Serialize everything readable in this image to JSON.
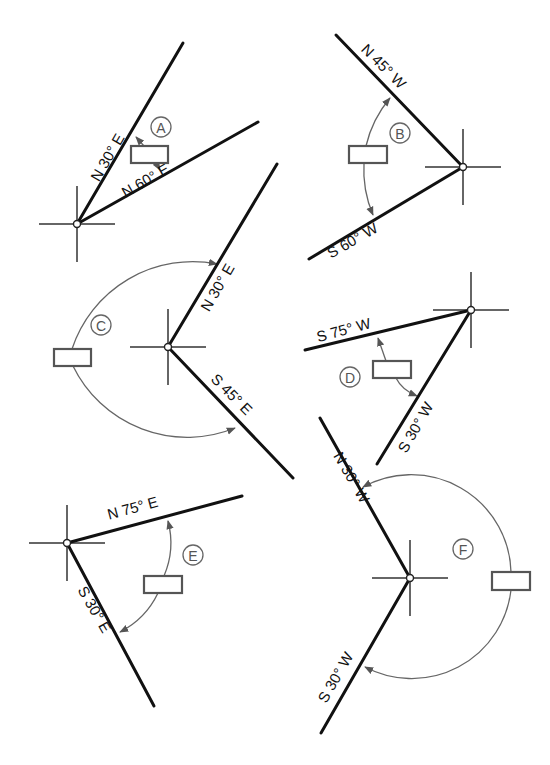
{
  "header": {
    "cropped_text": ""
  },
  "figures": [
    {
      "id": "A",
      "center": [
        77,
        224
      ],
      "bearings": [
        {
          "label": "N 30° E",
          "end": [
            183,
            43
          ],
          "text_pos": [
            112,
            160
          ],
          "text_angle": -60
        },
        {
          "label": "N 60° E",
          "end": [
            258,
            122
          ],
          "text_pos": [
            148,
            185
          ],
          "text_angle": -30
        }
      ],
      "answer_box": {
        "x": 131,
        "y": 146,
        "w": 37,
        "h": 17,
        "value": ""
      },
      "tag_pos": [
        161,
        127
      ]
    },
    {
      "id": "B",
      "center": [
        463,
        167
      ],
      "bearings": [
        {
          "label": "N 45° W",
          "end": [
            336,
            35
          ],
          "text_pos": [
            380,
            70
          ],
          "text_angle": 45
        },
        {
          "label": "S 60° W",
          "end": [
            309,
            259
          ],
          "text_pos": [
            355,
            245
          ],
          "text_angle": -30
        }
      ],
      "answer_box": {
        "x": 349,
        "y": 146,
        "w": 38,
        "h": 17,
        "value": ""
      },
      "tag_pos": [
        400,
        133
      ]
    },
    {
      "id": "C",
      "center": [
        168,
        347
      ],
      "bearings": [
        {
          "label": "N 30° E",
          "end": [
            277,
            164
          ],
          "text_pos": [
            222,
            290
          ],
          "text_angle": -60
        },
        {
          "label": "S 45° E",
          "end": [
            293,
            478
          ],
          "text_pos": [
            228,
            398
          ],
          "text_angle": 45
        }
      ],
      "answer_box": {
        "x": 54,
        "y": 349,
        "w": 37,
        "h": 17,
        "value": ""
      },
      "tag_pos": [
        101,
        325
      ]
    },
    {
      "id": "D",
      "center": [
        471,
        310
      ],
      "bearings": [
        {
          "label": "S 75° W",
          "end": [
            305,
            350
          ],
          "text_pos": [
            345,
            335
          ],
          "text_angle": -15
        },
        {
          "label": "S 30° W",
          "end": [
            377,
            464
          ],
          "text_pos": [
            420,
            430
          ],
          "text_angle": -60
        }
      ],
      "answer_box": {
        "x": 373,
        "y": 361,
        "w": 38,
        "h": 17,
        "value": ""
      },
      "tag_pos": [
        350,
        377
      ]
    },
    {
      "id": "E",
      "center": [
        67,
        543
      ],
      "bearings": [
        {
          "label": "N 75° E",
          "end": [
            242,
            496
          ],
          "text_pos": [
            134,
            513
          ],
          "text_angle": -15
        },
        {
          "label": "S 30° E",
          "end": [
            154,
            706
          ],
          "text_pos": [
            90,
            612
          ],
          "text_angle": 60
        }
      ],
      "answer_box": {
        "x": 144,
        "y": 576,
        "w": 38,
        "h": 17,
        "value": ""
      },
      "tag_pos": [
        193,
        555
      ]
    },
    {
      "id": "F",
      "center": [
        410,
        578
      ],
      "bearings": [
        {
          "label": "N 30° W",
          "end": [
            320,
            418
          ],
          "text_pos": [
            347,
            480
          ],
          "text_angle": 60
        },
        {
          "label": "S 30° W",
          "end": [
            321,
            733
          ],
          "text_pos": [
            340,
            680
          ],
          "text_angle": -60
        }
      ],
      "answer_box": {
        "x": 492,
        "y": 572,
        "w": 38,
        "h": 18,
        "value": ""
      },
      "tag_pos": [
        463,
        549
      ]
    }
  ],
  "colors": {
    "line": "#111111",
    "arc": "#666666",
    "box_border": "#555555",
    "background": "#ffffff"
  }
}
